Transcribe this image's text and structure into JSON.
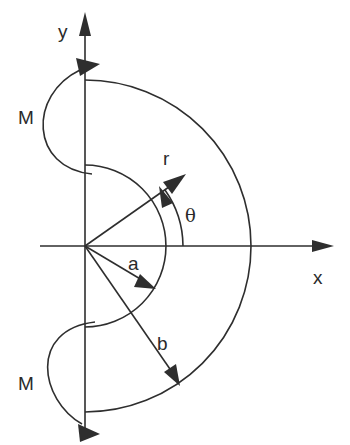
{
  "diagram": {
    "labels": {
      "y_axis": "y",
      "x_axis": "x",
      "moment_top": "M",
      "moment_bottom": "M",
      "radial": "r",
      "angle": "θ",
      "inner_radius": "a",
      "outer_radius": "b"
    },
    "geometry": {
      "origin": [
        85,
        246
      ],
      "inner_radius_px": 81,
      "outer_radius_px": 166
    },
    "colors": {
      "stroke": "#2e2e2e",
      "background": "#ffffff"
    }
  }
}
